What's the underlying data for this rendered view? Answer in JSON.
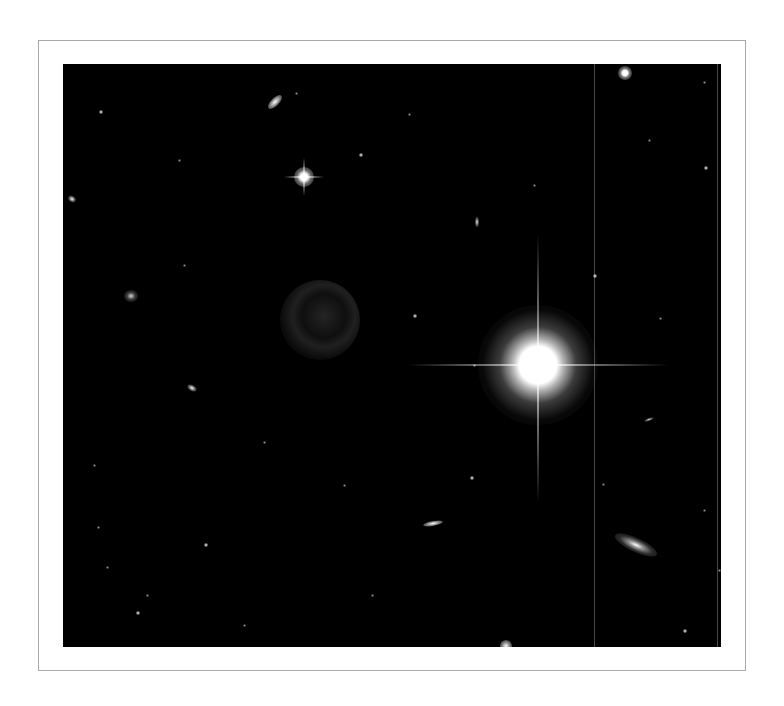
{
  "image": {
    "subject": "deep-field astronomical image",
    "background_color": "#000000",
    "frame_border_color": "#a9a9a9",
    "page_background": "#ffffff"
  },
  "objects": [
    {
      "type": "bright-star",
      "x": 475,
      "y": 301,
      "size": 64
    },
    {
      "type": "star",
      "x": 241,
      "y": 113,
      "size": 14
    },
    {
      "type": "star",
      "x": 562,
      "y": 9,
      "size": 9
    },
    {
      "type": "star",
      "x": 443,
      "y": 582,
      "size": 8
    },
    {
      "type": "ghost-ring",
      "x": 257,
      "y": 256,
      "size": 80
    },
    {
      "type": "galaxy",
      "x": 212,
      "y": 38,
      "w": 18,
      "h": 8,
      "rot": -45
    },
    {
      "type": "galaxy-spiral",
      "x": 573,
      "y": 481,
      "w": 46,
      "h": 14,
      "rot": 25
    },
    {
      "type": "galaxy",
      "x": 370,
      "y": 460,
      "w": 20,
      "h": 5,
      "rot": -10
    },
    {
      "type": "galaxy",
      "x": 68,
      "y": 232,
      "w": 14,
      "h": 12,
      "rot": 0
    },
    {
      "type": "galaxy",
      "x": 129,
      "y": 324,
      "w": 10,
      "h": 6,
      "rot": 30
    },
    {
      "type": "galaxy",
      "x": 9,
      "y": 135,
      "w": 8,
      "h": 6,
      "rot": 30
    },
    {
      "type": "galaxy",
      "x": 414,
      "y": 158,
      "w": 4,
      "h": 10,
      "rot": 0
    },
    {
      "type": "galaxy",
      "x": 586,
      "y": 356,
      "w": 10,
      "h": 3,
      "rot": -20
    }
  ],
  "faint_points": [
    [
      36,
      46
    ],
    [
      115,
      95
    ],
    [
      232,
      28
    ],
    [
      296,
      89
    ],
    [
      345,
      49
    ],
    [
      640,
      17
    ],
    [
      641,
      102
    ],
    [
      596,
      253
    ],
    [
      34,
      462
    ],
    [
      141,
      479
    ],
    [
      43,
      502
    ],
    [
      83,
      530
    ],
    [
      73,
      547
    ],
    [
      200,
      377
    ],
    [
      308,
      530
    ],
    [
      407,
      412
    ],
    [
      539,
      419
    ],
    [
      655,
      505
    ],
    [
      620,
      565
    ],
    [
      410,
      300
    ],
    [
      120,
      200
    ],
    [
      530,
      210
    ],
    [
      585,
      75
    ],
    [
      640,
      445
    ],
    [
      690,
      200
    ],
    [
      180,
      560
    ],
    [
      280,
      420
    ],
    [
      350,
      250
    ],
    [
      470,
      120
    ],
    [
      30,
      400
    ]
  ],
  "artifacts": {
    "vertical_lines_x": [
      531,
      654
    ]
  }
}
